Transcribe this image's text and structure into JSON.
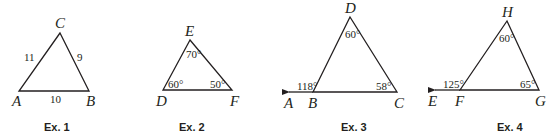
{
  "examples": [
    {
      "caption": "Ex. 1",
      "vertices": {
        "top": "C",
        "left": "A",
        "right": "B"
      },
      "sides": {
        "left": "11",
        "right": "9",
        "base": "10"
      }
    },
    {
      "caption": "Ex. 2",
      "vertices": {
        "top": "E",
        "left": "D",
        "right": "F"
      },
      "angles": {
        "top": "70°",
        "left": "60°",
        "right": "50°"
      }
    },
    {
      "caption": "Ex. 3",
      "vertices": {
        "top": "D",
        "left": "B",
        "right": "C",
        "ext": "A"
      },
      "angles": {
        "top": "60°",
        "exterior": "118°",
        "right": "58°"
      }
    },
    {
      "caption": "Ex. 4",
      "vertices": {
        "top": "H",
        "left": "F",
        "right": "G",
        "ext": "E"
      },
      "angles": {
        "top": "60°",
        "exterior": "125°",
        "right": "65°"
      }
    }
  ]
}
